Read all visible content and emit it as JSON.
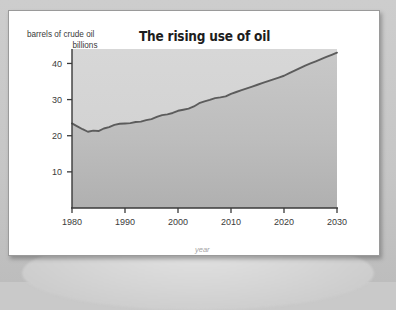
{
  "card": {
    "title": "The rising use of oil",
    "y_axis_label_line1": "barrels of crude oil",
    "y_axis_label_line2": "billions",
    "x_axis_label": "year"
  },
  "colors": {
    "page_background": "#c9c9c9",
    "card_background": "#ffffff",
    "card_border": "#9a9a9a",
    "area_fill_top": "#c6c6c6",
    "area_fill_bottom": "#b4b4b4",
    "plot_background": "#d2d2d2",
    "line": "#5c5c5c",
    "axis": "#3a3a3a",
    "title_text": "#1d1d1d",
    "tick_text": "#3b3b3b",
    "xlabel_text": "#a4a4a4"
  },
  "chart_data": {
    "type": "area",
    "title": "The rising use of oil",
    "xlabel": "year",
    "ylabel": "barrels of crude oil billions",
    "xlim": [
      1980,
      2030
    ],
    "ylim": [
      0,
      44
    ],
    "grid": false,
    "legend": null,
    "xticks": [
      1980,
      1990,
      2000,
      2010,
      2020,
      2030
    ],
    "yticks": [
      10,
      20,
      30,
      40
    ],
    "x": [
      1980,
      1981,
      1982,
      1983,
      1984,
      1985,
      1986,
      1987,
      1988,
      1989,
      1990,
      1991,
      1992,
      1993,
      1994,
      1995,
      1996,
      1997,
      1998,
      1999,
      2000,
      2001,
      2002,
      2003,
      2004,
      2005,
      2006,
      2007,
      2008,
      2009,
      2010,
      2011,
      2012,
      2013,
      2014,
      2015,
      2016,
      2017,
      2018,
      2019,
      2020,
      2021,
      2022,
      2023,
      2024,
      2025,
      2026,
      2027,
      2028,
      2029,
      2030
    ],
    "values": [
      23.4,
      22.6,
      21.8,
      21.1,
      21.4,
      21.3,
      22.0,
      22.4,
      23.0,
      23.3,
      23.4,
      23.5,
      23.8,
      23.9,
      24.3,
      24.6,
      25.2,
      25.7,
      25.9,
      26.3,
      26.9,
      27.2,
      27.5,
      28.1,
      29.0,
      29.5,
      29.9,
      30.4,
      30.6,
      30.9,
      31.6,
      32.1,
      32.6,
      33.1,
      33.6,
      34.1,
      34.6,
      35.1,
      35.6,
      36.1,
      36.6,
      37.3,
      38.0,
      38.7,
      39.4,
      40.0,
      40.6,
      41.2,
      41.8,
      42.4,
      43.0
    ],
    "series": [
      {
        "name": "World oil use",
        "units": "billions of barrels of crude oil per year",
        "values": [
          23.4,
          22.6,
          21.8,
          21.1,
          21.4,
          21.3,
          22.0,
          22.4,
          23.0,
          23.3,
          23.4,
          23.5,
          23.8,
          23.9,
          24.3,
          24.6,
          25.2,
          25.7,
          25.9,
          26.3,
          26.9,
          27.2,
          27.5,
          28.1,
          29.0,
          29.5,
          29.9,
          30.4,
          30.6,
          30.9,
          31.6,
          32.1,
          32.6,
          33.1,
          33.6,
          34.1,
          34.6,
          35.1,
          35.6,
          36.1,
          36.6,
          37.3,
          38.0,
          38.7,
          39.4,
          40.0,
          40.6,
          41.2,
          41.8,
          42.4,
          43.0
        ]
      }
    ]
  }
}
